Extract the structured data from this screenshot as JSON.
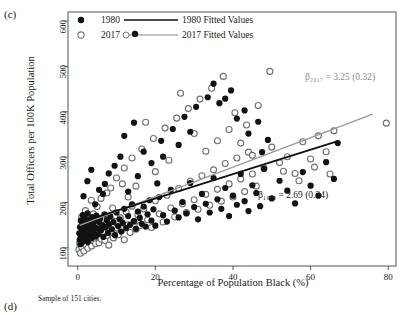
{
  "panel": {
    "label_c": "(c)",
    "label_d": "(d)"
  },
  "axes": {
    "ylabel": "Total Officers per 100K Population",
    "xlabel": "Percentage of Population Black (%)",
    "yticks": [
      100,
      200,
      300,
      400,
      500,
      600
    ],
    "xticks": [
      0,
      20,
      40,
      60,
      80
    ],
    "xlim": [
      -2.5,
      82
    ],
    "ylim": [
      60,
      620
    ]
  },
  "caption": "Sample of 151 cities.",
  "legend": {
    "items": [
      {
        "marker": "filled-circle",
        "label": "1980",
        "line_label": "1980 Fitted Values",
        "color": "#111111"
      },
      {
        "marker": "open-circle",
        "label": "2017",
        "line_label": "2017 Fitted Values",
        "color": "#8a8a8a"
      }
    ]
  },
  "annotations": [
    {
      "name": "beta-2017",
      "text": "β₂₀₁₇ = 3.25 (0.32)",
      "coef": 3.25,
      "se": 0.32,
      "series": "2017",
      "color": "#8a8a8a"
    },
    {
      "name": "beta-1980",
      "text": "β₁₉₈₀ = 2.69 (0.34)",
      "coef": 2.69,
      "se": 0.34,
      "series": "1980",
      "color": "#1a1a1a"
    }
  ],
  "chart_data": {
    "type": "scatter",
    "title": "",
    "xlabel": "Percentage of Population Black (%)",
    "ylabel": "Total Officers per 100K Population",
    "xlim": [
      -2.5,
      82
    ],
    "ylim": [
      60,
      620
    ],
    "grid": false,
    "legend_position": "top-left-inside",
    "n_cities": 151,
    "series": [
      {
        "name": "1980",
        "marker": "filled-circle",
        "color": "#111111",
        "fit": {
          "slope": 2.69,
          "se": 0.34,
          "intercept": 155,
          "x_start": 0.5,
          "x_end": 67
        },
        "points": [
          [
            0.4,
            132
          ],
          [
            0.5,
            118
          ],
          [
            0.6,
            146
          ],
          [
            0.7,
            108
          ],
          [
            0.8,
            160
          ],
          [
            0.9,
            126
          ],
          [
            1.0,
            141
          ],
          [
            1.1,
            112
          ],
          [
            1.2,
            154
          ],
          [
            1.3,
            172
          ],
          [
            1.4,
            129
          ],
          [
            1.5,
            150
          ],
          [
            1.6,
            123
          ],
          [
            1.8,
            166
          ],
          [
            1.9,
            137
          ],
          [
            2.0,
            119
          ],
          [
            2.1,
            158
          ],
          [
            2.2,
            144
          ],
          [
            2.4,
            131
          ],
          [
            2.5,
            176
          ],
          [
            2.6,
            113
          ],
          [
            2.8,
            149
          ],
          [
            3.0,
            163
          ],
          [
            3.1,
            127
          ],
          [
            3.3,
            140
          ],
          [
            3.5,
            155
          ],
          [
            3.6,
            121
          ],
          [
            3.8,
            168
          ],
          [
            4.0,
            134
          ],
          [
            4.2,
            147
          ],
          [
            4.4,
            159
          ],
          [
            4.6,
            125
          ],
          [
            4.8,
            171
          ],
          [
            5.0,
            143
          ],
          [
            5.2,
            130
          ],
          [
            5.5,
            157
          ],
          [
            5.8,
            165
          ],
          [
            6.0,
            138
          ],
          [
            6.3,
            150
          ],
          [
            6.6,
            124
          ],
          [
            6.9,
            174
          ],
          [
            7.2,
            146
          ],
          [
            7.5,
            161
          ],
          [
            7.8,
            133
          ],
          [
            8.1,
            152
          ],
          [
            8.4,
            169
          ],
          [
            8.8,
            141
          ],
          [
            9.2,
            157
          ],
          [
            9.6,
            128
          ],
          [
            10.0,
            178
          ],
          [
            10.4,
            148
          ],
          [
            10.8,
            163
          ],
          [
            11.2,
            136
          ],
          [
            11.6,
            155
          ],
          [
            12.0,
            186
          ],
          [
            12.5,
            144
          ],
          [
            13.0,
            170
          ],
          [
            13.5,
            151
          ],
          [
            14.0,
            196
          ],
          [
            14.5,
            159
          ],
          [
            15.0,
            142
          ],
          [
            15.5,
            180
          ],
          [
            16.0,
            166
          ],
          [
            16.5,
            153
          ],
          [
            17.0,
            191
          ],
          [
            17.5,
            147
          ],
          [
            18.0,
            174
          ],
          [
            18.5,
            205
          ],
          [
            19.0,
            160
          ],
          [
            19.5,
            185
          ],
          [
            20.0,
            149
          ],
          [
            21.0,
            212
          ],
          [
            22.0,
            172
          ],
          [
            23.0,
            158
          ],
          [
            24.0,
            228
          ],
          [
            25.0,
            182
          ],
          [
            26.0,
            167
          ],
          [
            27.0,
            201
          ],
          [
            28.0,
            176
          ],
          [
            29.0,
            243
          ],
          [
            30.0,
            190
          ],
          [
            31.0,
            163
          ],
          [
            32.0,
            219
          ],
          [
            33.0,
            197
          ],
          [
            34.0,
            178
          ],
          [
            35.0,
            254
          ],
          [
            36.0,
            207
          ],
          [
            37.0,
            186
          ],
          [
            38.0,
            232
          ],
          [
            39.0,
            170
          ],
          [
            40.0,
            215
          ],
          [
            41.0,
            195
          ],
          [
            42.0,
            263
          ],
          [
            43.0,
            203
          ],
          [
            44.0,
            181
          ],
          [
            45.0,
            238
          ],
          [
            46.0,
            221
          ],
          [
            47.0,
            192
          ],
          [
            48.0,
            274
          ],
          [
            50.0,
            209
          ],
          [
            52.0,
            248
          ],
          [
            54.0,
            226
          ],
          [
            56.0,
            198
          ],
          [
            58.0,
            267
          ],
          [
            60.0,
            237
          ],
          [
            62.0,
            215
          ],
          [
            64.0,
            289
          ],
          [
            66.0,
            252
          ],
          [
            67.0,
            331
          ],
          [
            6.5,
            219
          ],
          [
            7.0,
            241
          ],
          [
            8.0,
            264
          ],
          [
            9.5,
            281
          ],
          [
            11.0,
            301
          ],
          [
            13.0,
            224
          ],
          [
            15.5,
            258
          ],
          [
            17.0,
            312
          ],
          [
            19.0,
            287
          ],
          [
            21.5,
            336
          ],
          [
            24.5,
            362
          ],
          [
            27.5,
            389
          ],
          [
            30.5,
            411
          ],
          [
            33.5,
            432
          ],
          [
            36.5,
            419
          ],
          [
            39.5,
            447
          ],
          [
            12.0,
            347
          ],
          [
            14.5,
            376
          ],
          [
            22.0,
            301
          ],
          [
            26.0,
            327
          ],
          [
            29.0,
            356
          ],
          [
            1.5,
            214
          ],
          [
            2.5,
            247
          ],
          [
            3.5,
            272
          ],
          [
            4.5,
            196
          ],
          [
            5.5,
            228
          ],
          [
            43.0,
            403
          ],
          [
            46.5,
            378
          ],
          [
            35.0,
            462
          ],
          [
            38.0,
            429
          ],
          [
            41.0,
            385
          ],
          [
            44.0,
            352
          ],
          [
            47.5,
            311
          ],
          [
            49.0,
            338
          ],
          [
            20.5,
            242
          ]
        ]
      },
      {
        "name": "2017",
        "marker": "open-circle",
        "color": "#777777",
        "fit": {
          "slope": 3.25,
          "se": 0.32,
          "intercept": 148,
          "x_start": 0.5,
          "x_end": 76
        },
        "points": [
          [
            0.3,
            96
          ],
          [
            0.5,
            110
          ],
          [
            0.7,
            88
          ],
          [
            0.9,
            124
          ],
          [
            1.0,
            102
          ],
          [
            1.2,
            135
          ],
          [
            1.4,
            115
          ],
          [
            1.6,
            93
          ],
          [
            1.8,
            147
          ],
          [
            2.0,
            120
          ],
          [
            2.2,
            106
          ],
          [
            2.4,
            138
          ],
          [
            2.6,
            99
          ],
          [
            2.8,
            128
          ],
          [
            3.0,
            113
          ],
          [
            3.2,
            152
          ],
          [
            3.4,
            121
          ],
          [
            3.6,
            104
          ],
          [
            3.8,
            143
          ],
          [
            4.0,
            117
          ],
          [
            4.3,
            131
          ],
          [
            4.6,
            109
          ],
          [
            4.9,
            156
          ],
          [
            5.2,
            125
          ],
          [
            5.5,
            111
          ],
          [
            5.8,
            140
          ],
          [
            6.1,
            119
          ],
          [
            6.4,
            163
          ],
          [
            6.7,
            133
          ],
          [
            7.0,
            116
          ],
          [
            7.3,
            148
          ],
          [
            7.6,
            127
          ],
          [
            8.0,
            106
          ],
          [
            8.4,
            158
          ],
          [
            8.8,
            137
          ],
          [
            9.2,
            122
          ],
          [
            9.6,
            171
          ],
          [
            10.0,
            144
          ],
          [
            10.5,
            129
          ],
          [
            11.0,
            166
          ],
          [
            11.5,
            140
          ],
          [
            12.0,
            118
          ],
          [
            12.5,
            179
          ],
          [
            13.0,
            151
          ],
          [
            13.5,
            134
          ],
          [
            14.0,
            192
          ],
          [
            14.5,
            158
          ],
          [
            15.0,
            141
          ],
          [
            15.5,
            173
          ],
          [
            16.0,
            149
          ],
          [
            17.0,
            186
          ],
          [
            18.0,
            162
          ],
          [
            19.0,
            145
          ],
          [
            20.0,
            204
          ],
          [
            21.0,
            175
          ],
          [
            22.0,
            157
          ],
          [
            23.0,
            216
          ],
          [
            24.0,
            188
          ],
          [
            25.0,
            168
          ],
          [
            26.0,
            231
          ],
          [
            27.0,
            197
          ],
          [
            28.0,
            178
          ],
          [
            29.0,
            247
          ],
          [
            30.0,
            206
          ],
          [
            31.0,
            185
          ],
          [
            32.0,
            259
          ],
          [
            33.0,
            218
          ],
          [
            34.0,
            194
          ],
          [
            35.0,
            272
          ],
          [
            36.0,
            229
          ],
          [
            37.0,
            203
          ],
          [
            38.0,
            286
          ],
          [
            39.0,
            241
          ],
          [
            40.0,
            212
          ],
          [
            41.0,
            298
          ],
          [
            42.0,
            252
          ],
          [
            43.0,
            224
          ],
          [
            44.0,
            311
          ],
          [
            45.0,
            263
          ],
          [
            46.0,
            236
          ],
          [
            48.0,
            276
          ],
          [
            50.0,
            322
          ],
          [
            52.0,
            288
          ],
          [
            54.0,
            301
          ],
          [
            56.0,
            264
          ],
          [
            58.0,
            334
          ],
          [
            60.0,
            296
          ],
          [
            62.0,
            347
          ],
          [
            64.0,
            312
          ],
          [
            66.0,
            358
          ],
          [
            79.5,
            375
          ],
          [
            5.0,
            191
          ],
          [
            6.0,
            209
          ],
          [
            8.5,
            232
          ],
          [
            10.0,
            254
          ],
          [
            12.0,
            276
          ],
          [
            14.0,
            298
          ],
          [
            16.5,
            318
          ],
          [
            19.5,
            341
          ],
          [
            22.5,
            364
          ],
          [
            25.5,
            386
          ],
          [
            28.5,
            407
          ],
          [
            31.5,
            428
          ],
          [
            34.5,
            452
          ],
          [
            37.5,
            478
          ],
          [
            40.5,
            398
          ],
          [
            43.5,
            371
          ],
          [
            46.5,
            414
          ],
          [
            49.5,
            489
          ],
          [
            20.0,
            268
          ],
          [
            23.5,
            293
          ],
          [
            2.0,
            182
          ],
          [
            3.5,
            205
          ],
          [
            7.5,
            221
          ],
          [
            9.0,
            188
          ],
          [
            11.5,
            241
          ],
          [
            17.5,
            377
          ],
          [
            26.5,
            441
          ],
          [
            30.0,
            352
          ],
          [
            33.0,
            313
          ],
          [
            36.0,
            336
          ],
          [
            39.0,
            361
          ],
          [
            42.0,
            331
          ],
          [
            45.0,
            304
          ],
          [
            53.0,
            269
          ],
          [
            57.0,
            248
          ],
          [
            61.0,
            278
          ],
          [
            65.0,
            263
          ],
          [
            1.0,
            168
          ],
          [
            4.0,
            175
          ],
          [
            13.0,
            212
          ],
          [
            15.0,
            236
          ]
        ]
      }
    ]
  }
}
